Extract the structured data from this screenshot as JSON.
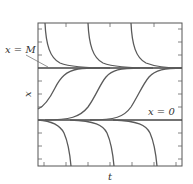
{
  "diagram": {
    "type": "solution-curves",
    "title": "",
    "axes": {
      "xlabel": "t",
      "ylabel": "x"
    },
    "annotations": {
      "upper_equilibrium": "x = M",
      "lower_equilibrium": "x = 0"
    },
    "frame": {
      "left": 38,
      "top": 23,
      "right": 182,
      "bottom": 166
    },
    "equilibria_y": {
      "M": 68,
      "zero": 120
    },
    "tick_spacing_px": 13,
    "curve_families": {
      "above_M": "decreasing toward x = M",
      "between_0_and_M": "S-shaped, increasing from x = 0 toward x = M",
      "below_0": "decreasing away from x = 0"
    },
    "curve_color": "#5a5a5a"
  }
}
